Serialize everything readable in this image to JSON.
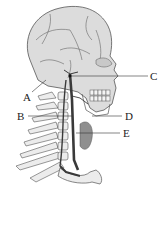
{
  "diagram": {
    "labels": [
      {
        "id": "A",
        "text": "A"
      },
      {
        "id": "B",
        "text": "B"
      },
      {
        "id": "C",
        "text": "C"
      },
      {
        "id": "D",
        "text": "D"
      },
      {
        "id": "E",
        "text": "E"
      }
    ]
  },
  "colors": {
    "skull_fill": "#d9d9d9",
    "outline": "#4a4a4a",
    "vein": "#3a3a3a",
    "muscle": "#8c8c8c",
    "bone_light": "#ececec"
  }
}
